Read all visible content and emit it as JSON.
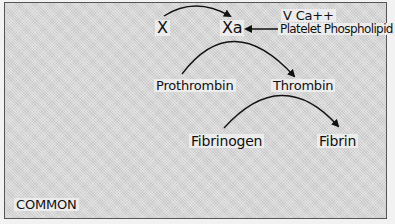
{
  "diagram": {
    "section_label": "COMMON",
    "nodes": {
      "x": "X",
      "xa": "Xa",
      "cofactors_line1": "V Ca++",
      "cofactors_line2": "Platelet Phospholipid",
      "prothrombin": "Prothrombin",
      "thrombin": "Thrombin",
      "fibrinogen": "Fibrinogen",
      "fibrin": "Fibrin"
    },
    "edges": [
      {
        "from": "X",
        "to": "Xa",
        "style": "curved"
      },
      {
        "from": "V Ca++ Platelet Phospholipid",
        "to": "Xa",
        "style": "straight"
      },
      {
        "from": "Prothrombin",
        "to": "Thrombin",
        "style": "curved"
      },
      {
        "from": "Fibrinogen",
        "to": "Fibrin",
        "style": "curved"
      }
    ],
    "colors": {
      "ink": "#111111",
      "background": "#d4d4d4"
    }
  }
}
